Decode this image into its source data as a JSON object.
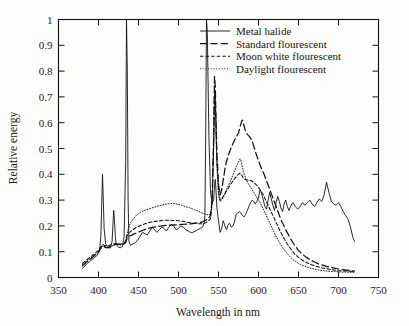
{
  "chart_data": {
    "type": "line",
    "title": "",
    "xlabel": "Wavelength in nm",
    "ylabel": "Relative energy",
    "xlim": [
      350,
      750
    ],
    "ylim": [
      0,
      1
    ],
    "xticks": [
      350,
      400,
      450,
      500,
      550,
      600,
      650,
      700,
      750
    ],
    "yticks": [
      "0",
      "0.1",
      "0.2",
      "0.3",
      "0.4",
      "0.5",
      "0.6",
      "0.7",
      "0.8",
      "0.9",
      "1"
    ],
    "grid": false,
    "legend_position": "top-right",
    "series": [
      {
        "name": "Metal halide",
        "style": "solid",
        "x": [
          380,
          383,
          386,
          389,
          392,
          395,
          398,
          401,
          403,
          404,
          405,
          406,
          407,
          409,
          412,
          415,
          417,
          418,
          419,
          420,
          421,
          422,
          424,
          427,
          430,
          432,
          434,
          435,
          436,
          437,
          438,
          440,
          443,
          446,
          449,
          452,
          455,
          458,
          461,
          464,
          467,
          470,
          473,
          476,
          479,
          482,
          485,
          488,
          491,
          494,
          497,
          500,
          503,
          506,
          509,
          512,
          515,
          518,
          521,
          524,
          527,
          530,
          532,
          533,
          534,
          535,
          536,
          538,
          540,
          542,
          544,
          545,
          546,
          547,
          548,
          550,
          552,
          554,
          556,
          558,
          560,
          562,
          564,
          566,
          568,
          570,
          572,
          574,
          576,
          578,
          580,
          582,
          584,
          586,
          588,
          590,
          592,
          594,
          596,
          598,
          600,
          602,
          604,
          606,
          608,
          610,
          612,
          614,
          616,
          618,
          620,
          622,
          624,
          626,
          628,
          630,
          632,
          634,
          636,
          638,
          640,
          643,
          646,
          649,
          652,
          655,
          658,
          661,
          664,
          667,
          670,
          673,
          676,
          679,
          682,
          685,
          688,
          691,
          694,
          697,
          700,
          703,
          706,
          709,
          712,
          715,
          718,
          720
        ],
        "y": [
          0.035,
          0.045,
          0.055,
          0.062,
          0.07,
          0.078,
          0.085,
          0.1,
          0.16,
          0.28,
          0.4,
          0.3,
          0.19,
          0.13,
          0.115,
          0.115,
          0.14,
          0.2,
          0.26,
          0.22,
          0.16,
          0.13,
          0.12,
          0.115,
          0.12,
          0.16,
          0.45,
          1.0,
          0.8,
          0.3,
          0.14,
          0.125,
          0.13,
          0.135,
          0.145,
          0.16,
          0.175,
          0.17,
          0.165,
          0.18,
          0.195,
          0.185,
          0.175,
          0.185,
          0.195,
          0.19,
          0.18,
          0.195,
          0.205,
          0.2,
          0.185,
          0.19,
          0.2,
          0.195,
          0.185,
          0.18,
          0.175,
          0.175,
          0.18,
          0.185,
          0.19,
          0.195,
          0.21,
          0.24,
          0.55,
          1.0,
          0.95,
          0.55,
          0.33,
          0.29,
          0.3,
          0.36,
          0.38,
          0.33,
          0.27,
          0.22,
          0.175,
          0.19,
          0.22,
          0.2,
          0.185,
          0.205,
          0.21,
          0.195,
          0.2,
          0.215,
          0.245,
          0.25,
          0.255,
          0.25,
          0.24,
          0.235,
          0.245,
          0.26,
          0.275,
          0.29,
          0.3,
          0.295,
          0.285,
          0.295,
          0.31,
          0.34,
          0.325,
          0.3,
          0.275,
          0.265,
          0.3,
          0.33,
          0.305,
          0.28,
          0.26,
          0.29,
          0.315,
          0.295,
          0.27,
          0.255,
          0.285,
          0.3,
          0.275,
          0.26,
          0.275,
          0.29,
          0.275,
          0.265,
          0.275,
          0.29,
          0.28,
          0.29,
          0.3,
          0.285,
          0.275,
          0.29,
          0.305,
          0.295,
          0.32,
          0.37,
          0.33,
          0.295,
          0.285,
          0.28,
          0.29,
          0.275,
          0.255,
          0.24,
          0.225,
          0.195,
          0.155,
          0.14
        ]
      },
      {
        "name": "Standard flourescent",
        "style": "long-dash",
        "x": [
          380,
          385,
          390,
          395,
          400,
          403,
          405,
          407,
          410,
          413,
          416,
          419,
          422,
          425,
          428,
          431,
          434,
          435,
          436,
          438,
          441,
          444,
          447,
          450,
          455,
          460,
          465,
          470,
          475,
          480,
          485,
          490,
          495,
          500,
          505,
          510,
          515,
          520,
          525,
          530,
          534,
          537,
          540,
          542,
          544,
          545,
          546,
          547,
          548,
          550,
          552,
          554,
          556,
          558,
          560,
          563,
          566,
          569,
          572,
          575,
          577,
          579,
          580,
          581,
          583,
          586,
          589,
          592,
          595,
          598,
          601,
          604,
          607,
          610,
          613,
          616,
          619,
          622,
          625,
          628,
          631,
          634,
          637,
          640,
          645,
          650,
          655,
          660,
          665,
          670,
          675,
          680,
          685,
          690,
          695,
          700,
          705,
          710,
          715,
          720
        ],
        "y": [
          0.045,
          0.06,
          0.072,
          0.085,
          0.1,
          0.115,
          0.125,
          0.12,
          0.115,
          0.118,
          0.122,
          0.126,
          0.13,
          0.128,
          0.127,
          0.129,
          0.135,
          0.145,
          0.155,
          0.16,
          0.163,
          0.168,
          0.172,
          0.176,
          0.182,
          0.188,
          0.192,
          0.196,
          0.198,
          0.2,
          0.202,
          0.203,
          0.204,
          0.205,
          0.206,
          0.207,
          0.208,
          0.21,
          0.212,
          0.216,
          0.222,
          0.228,
          0.24,
          0.3,
          0.55,
          0.78,
          0.74,
          0.6,
          0.48,
          0.36,
          0.32,
          0.34,
          0.38,
          0.42,
          0.45,
          0.48,
          0.505,
          0.525,
          0.545,
          0.56,
          0.585,
          0.605,
          0.61,
          0.6,
          0.575,
          0.555,
          0.545,
          0.53,
          0.5,
          0.47,
          0.445,
          0.42,
          0.4,
          0.375,
          0.35,
          0.325,
          0.3,
          0.275,
          0.25,
          0.225,
          0.205,
          0.185,
          0.168,
          0.15,
          0.125,
          0.105,
          0.09,
          0.078,
          0.068,
          0.06,
          0.053,
          0.048,
          0.043,
          0.039,
          0.036,
          0.033,
          0.031,
          0.029,
          0.027,
          0.025
        ]
      },
      {
        "name": "Moon white flourescent",
        "style": "short-dash",
        "x": [
          380,
          385,
          390,
          395,
          400,
          403,
          405,
          407,
          410,
          413,
          416,
          419,
          422,
          425,
          428,
          431,
          434,
          435,
          437,
          440,
          443,
          446,
          450,
          455,
          460,
          465,
          470,
          475,
          480,
          485,
          490,
          495,
          500,
          505,
          510,
          515,
          520,
          525,
          530,
          534,
          537,
          540,
          542,
          544,
          545,
          546,
          547,
          548,
          550,
          552,
          554,
          556,
          558,
          560,
          563,
          566,
          569,
          572,
          575,
          577,
          579,
          580,
          582,
          585,
          588,
          591,
          594,
          597,
          600,
          603,
          606,
          609,
          612,
          615,
          618,
          621,
          624,
          627,
          630,
          633,
          636,
          640,
          645,
          650,
          655,
          660,
          665,
          670,
          675,
          680,
          685,
          690,
          695,
          700,
          705,
          710,
          715,
          720
        ],
        "y": [
          0.055,
          0.068,
          0.08,
          0.092,
          0.105,
          0.118,
          0.128,
          0.125,
          0.122,
          0.124,
          0.127,
          0.13,
          0.132,
          0.131,
          0.13,
          0.132,
          0.14,
          0.155,
          0.17,
          0.178,
          0.185,
          0.192,
          0.198,
          0.205,
          0.21,
          0.214,
          0.217,
          0.219,
          0.221,
          0.222,
          0.222,
          0.221,
          0.22,
          0.218,
          0.215,
          0.212,
          0.21,
          0.208,
          0.208,
          0.212,
          0.218,
          0.228,
          0.285,
          0.52,
          0.72,
          0.7,
          0.58,
          0.46,
          0.34,
          0.3,
          0.305,
          0.315,
          0.325,
          0.335,
          0.35,
          0.365,
          0.378,
          0.39,
          0.4,
          0.405,
          0.398,
          0.39,
          0.382,
          0.378,
          0.378,
          0.375,
          0.368,
          0.36,
          0.35,
          0.335,
          0.32,
          0.3,
          0.28,
          0.26,
          0.24,
          0.22,
          0.2,
          0.18,
          0.162,
          0.145,
          0.13,
          0.112,
          0.092,
          0.078,
          0.067,
          0.058,
          0.051,
          0.046,
          0.041,
          0.037,
          0.034,
          0.031,
          0.029,
          0.027,
          0.026,
          0.025,
          0.024,
          0.023
        ]
      },
      {
        "name": "Daylight flourescent",
        "style": "dotted",
        "x": [
          380,
          385,
          390,
          395,
          400,
          403,
          405,
          408,
          411,
          414,
          417,
          420,
          423,
          426,
          429,
          432,
          434,
          435,
          437,
          440,
          444,
          448,
          452,
          456,
          460,
          464,
          468,
          472,
          476,
          480,
          484,
          488,
          492,
          496,
          500,
          504,
          508,
          512,
          516,
          520,
          524,
          528,
          531,
          534,
          537,
          540,
          542,
          544,
          545,
          546,
          547,
          548,
          550,
          552,
          554,
          556,
          558,
          560,
          563,
          566,
          569,
          572,
          575,
          577,
          578,
          579,
          581,
          584,
          587,
          590,
          593,
          596,
          599,
          602,
          605,
          608,
          611,
          614,
          617,
          620,
          624,
          628,
          632,
          636,
          640,
          645,
          650,
          655,
          660,
          665,
          670,
          675,
          680,
          685,
          690,
          695,
          700,
          705,
          710,
          715,
          720
        ],
        "y": [
          0.05,
          0.062,
          0.074,
          0.086,
          0.098,
          0.112,
          0.122,
          0.118,
          0.116,
          0.118,
          0.122,
          0.126,
          0.128,
          0.127,
          0.126,
          0.13,
          0.14,
          0.16,
          0.185,
          0.212,
          0.23,
          0.243,
          0.252,
          0.258,
          0.263,
          0.267,
          0.271,
          0.275,
          0.278,
          0.281,
          0.284,
          0.286,
          0.287,
          0.286,
          0.283,
          0.28,
          0.276,
          0.272,
          0.268,
          0.263,
          0.258,
          0.252,
          0.248,
          0.245,
          0.243,
          0.245,
          0.29,
          0.52,
          0.7,
          0.66,
          0.54,
          0.43,
          0.32,
          0.295,
          0.3,
          0.31,
          0.325,
          0.34,
          0.36,
          0.382,
          0.405,
          0.428,
          0.448,
          0.46,
          0.455,
          0.44,
          0.412,
          0.385,
          0.365,
          0.35,
          0.335,
          0.32,
          0.305,
          0.29,
          0.272,
          0.252,
          0.232,
          0.212,
          0.192,
          0.172,
          0.148,
          0.126,
          0.108,
          0.092,
          0.079,
          0.065,
          0.055,
          0.047,
          0.041,
          0.036,
          0.032,
          0.029,
          0.027,
          0.025,
          0.024,
          0.023,
          0.022,
          0.021,
          0.021,
          0.02,
          0.02
        ]
      }
    ]
  },
  "legend": {
    "items": [
      {
        "label": "Metal halide",
        "style": "solid"
      },
      {
        "label": "Standard flourescent",
        "style": "long-dash"
      },
      {
        "label": "Moon white flourescent",
        "style": "short-dash"
      },
      {
        "label": "Daylight flourescent",
        "style": "dotted"
      }
    ]
  },
  "colors": {
    "ink": "#111111",
    "background": "#fdfdfb"
  }
}
